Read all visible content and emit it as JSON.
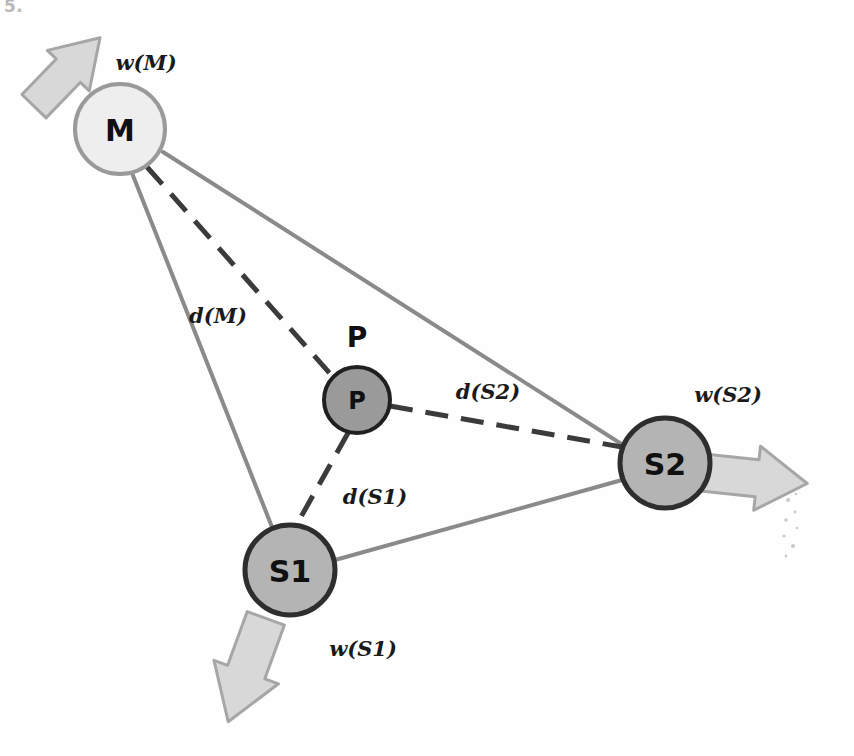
{
  "figure": {
    "background_color": "#fefefe",
    "corner_artifact": "5."
  },
  "colors": {
    "solid_edge": "#8a8a8a",
    "dashed_edge": "#3b3b3b",
    "node_light_fill": "#eeeeee",
    "node_light_stroke": "#9a9a9a",
    "node_mid_fill": "#b4b4b4",
    "node_mid_stroke": "#2e2e2e",
    "node_dark_fill": "#9a9a9a",
    "node_dark_stroke": "#1f1f1f",
    "arrow_fill": "#d8d8d8",
    "arrow_stroke": "#a6a6a6",
    "label_text": "#1a1a1a",
    "node_text": "#101010"
  },
  "nodes": [
    {
      "id": "M",
      "label": "M",
      "cx": 120,
      "cy": 129,
      "r": 45,
      "fill_key": "node_light_fill",
      "stroke_key": "node_light_stroke",
      "stroke_width": 4,
      "font_size": 30
    },
    {
      "id": "P",
      "label": "P",
      "cx": 357,
      "cy": 400,
      "r": 33,
      "fill_key": "node_dark_fill",
      "stroke_key": "node_dark_stroke",
      "stroke_width": 4,
      "font_size": 24
    },
    {
      "id": "S1",
      "label": "S1",
      "cx": 290,
      "cy": 570,
      "r": 45,
      "fill_key": "node_mid_fill",
      "stroke_key": "node_mid_stroke",
      "stroke_width": 5,
      "font_size": 30
    },
    {
      "id": "S2",
      "label": "S2",
      "cx": 665,
      "cy": 463,
      "r": 45,
      "fill_key": "node_mid_fill",
      "stroke_key": "node_mid_stroke",
      "stroke_width": 5,
      "font_size": 30
    }
  ],
  "solid_edges": [
    {
      "id": "M-S1",
      "from": "M",
      "to": "S1",
      "x1": 132,
      "y1": 173,
      "x2": 272,
      "y2": 527
    },
    {
      "id": "M-S2",
      "from": "M",
      "to": "S2",
      "x1": 163,
      "y1": 152,
      "x2": 623,
      "y2": 445
    },
    {
      "id": "S1-S2",
      "from": "S1",
      "to": "S2",
      "x1": 335,
      "y1": 560,
      "x2": 622,
      "y2": 480
    }
  ],
  "dashed_edges": [
    {
      "id": "d-M",
      "from": "M",
      "to": "P",
      "label": "d(M)",
      "x1": 147,
      "y1": 167,
      "x2": 334,
      "y2": 378,
      "label_x": 218,
      "label_y": 315
    },
    {
      "id": "d-S2",
      "from": "P",
      "to": "S2",
      "label": "d(S2)",
      "x1": 390,
      "y1": 406,
      "x2": 622,
      "y2": 447,
      "label_x": 488,
      "label_y": 391
    },
    {
      "id": "d-S1",
      "from": "P",
      "to": "S1",
      "label": "d(S1)",
      "x1": 348,
      "y1": 433,
      "x2": 297,
      "y2": 524,
      "label_x": 375,
      "label_y": 496
    }
  ],
  "weight_labels": [
    {
      "id": "w-M",
      "text": "w(M)",
      "x": 146,
      "y": 62,
      "font_size": 21
    },
    {
      "id": "w-S2",
      "text": "w(S2)",
      "x": 728,
      "y": 394,
      "font_size": 21
    },
    {
      "id": "w-S1",
      "text": "w(S1)",
      "x": 363,
      "y": 648,
      "font_size": 21
    }
  ],
  "arrows": [
    {
      "id": "arrow-M",
      "for_node": "M",
      "direction": "up-left",
      "rotation_deg": -46,
      "cx": 67,
      "cy": 72,
      "length": 95,
      "width": 56
    },
    {
      "id": "arrow-S2",
      "for_node": "S2",
      "direction": "right",
      "rotation_deg": 6,
      "cx": 755,
      "cy": 478,
      "length": 105,
      "width": 62
    },
    {
      "id": "arrow-S1",
      "for_node": "S1",
      "direction": "down-left",
      "rotation_deg": 110,
      "cx": 247,
      "cy": 670,
      "length": 110,
      "width": 66
    }
  ],
  "edge_style": {
    "solid_width": 4,
    "dashed_width": 5,
    "dash_pattern": "23 13"
  },
  "speckles": [
    {
      "x": 788,
      "y": 500,
      "r": 2.0
    },
    {
      "x": 795,
      "y": 512,
      "r": 1.4
    },
    {
      "x": 786,
      "y": 520,
      "r": 1.8
    },
    {
      "x": 797,
      "y": 528,
      "r": 1.3
    },
    {
      "x": 784,
      "y": 536,
      "r": 1.6
    },
    {
      "x": 793,
      "y": 546,
      "r": 2.1
    },
    {
      "x": 786,
      "y": 556,
      "r": 1.4
    },
    {
      "x": 796,
      "y": 494,
      "r": 1.2
    }
  ]
}
